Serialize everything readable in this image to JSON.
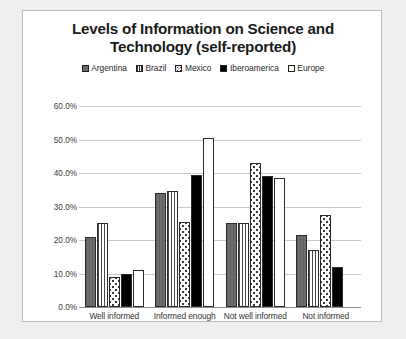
{
  "chart_data": {
    "type": "bar",
    "title": "Levels of Information on Science and Technology (self-reported)",
    "title_line1": "Levels of Information on Science and",
    "title_line2": "Technology (self-reported)",
    "xlabel": "",
    "ylabel": "",
    "ylim": [
      0,
      60
    ],
    "grid": true,
    "legend_position": "top",
    "categories": [
      "Well informed",
      "Informed enough",
      "Not well informed",
      "Not informed"
    ],
    "ytick_labels": [
      "0.0%",
      "10.0%",
      "20.0%",
      "30.0%",
      "40.0%",
      "50.0%",
      "60.0%"
    ],
    "ytick_values": [
      0,
      10,
      20,
      30,
      40,
      50,
      60
    ],
    "series": [
      {
        "name": "Argentina",
        "pattern": "solid-gray",
        "values": [
          21.0,
          34.0,
          25.0,
          21.5
        ]
      },
      {
        "name": "Brazil",
        "pattern": "vertical-stripes",
        "values": [
          25.0,
          34.5,
          25.0,
          17.0
        ]
      },
      {
        "name": "Mexico",
        "pattern": "dots",
        "values": [
          9.0,
          25.5,
          43.0,
          27.5
        ]
      },
      {
        "name": "Iberoamerica",
        "pattern": "solid-black",
        "values": [
          10.0,
          39.5,
          39.0,
          12.0
        ]
      },
      {
        "name": "Europe",
        "pattern": "white",
        "values": [
          11.0,
          50.5,
          38.5,
          0.0
        ]
      }
    ]
  }
}
